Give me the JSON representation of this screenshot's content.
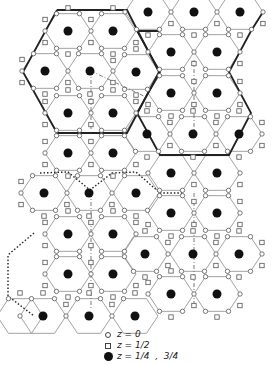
{
  "figure": {
    "width": 276,
    "height": 365,
    "hex_radius": 23,
    "colors": {
      "line": "#8a8a8a",
      "bold": "#222222",
      "dot": "#111111",
      "marker_stroke": "#555555"
    },
    "hexagon_centers": [
      [
        148,
        12
      ],
      [
        194,
        12
      ],
      [
        240,
        12
      ],
      [
        68,
        31
      ],
      [
        113,
        31
      ],
      [
        171,
        52
      ],
      [
        217,
        52
      ],
      [
        45,
        71
      ],
      [
        90,
        71
      ],
      [
        136,
        72
      ],
      [
        171,
        93
      ],
      [
        217,
        93
      ],
      [
        68,
        113
      ],
      [
        113,
        113
      ],
      [
        147,
        134
      ],
      [
        193,
        134
      ],
      [
        239,
        134
      ],
      [
        68,
        153
      ],
      [
        113,
        153
      ],
      [
        171,
        173
      ],
      [
        217,
        173
      ],
      [
        44,
        193
      ],
      [
        89,
        193
      ],
      [
        136,
        193
      ],
      [
        171,
        213
      ],
      [
        217,
        213
      ],
      [
        68,
        234
      ],
      [
        113,
        234
      ],
      [
        145,
        254
      ],
      [
        193,
        254
      ],
      [
        239,
        254
      ],
      [
        68,
        274
      ],
      [
        113,
        274
      ],
      [
        171,
        294
      ],
      [
        217,
        294
      ],
      [
        20,
        316
      ],
      [
        43,
        316
      ],
      [
        89,
        316
      ],
      [
        135,
        316
      ]
    ],
    "bold_outlines": [
      [
        [
          57,
          10
        ],
        [
          127,
          10
        ],
        [
          159,
          72
        ],
        [
          127,
          133
        ],
        [
          57,
          133
        ],
        [
          23,
          72
        ],
        [
          57,
          10
        ]
      ],
      [
        [
          159,
          31
        ],
        [
          137,
          31
        ],
        [
          160,
          72
        ],
        [
          137,
          113
        ],
        [
          160,
          155
        ],
        [
          183,
          155
        ],
        [
          229,
          155
        ],
        [
          251,
          113
        ],
        [
          229,
          72
        ],
        [
          251,
          31
        ],
        [
          263,
          12
        ]
      ]
    ],
    "dotted_outlines": [
      [
        [
          34,
          233
        ],
        [
          8,
          255
        ],
        [
          8,
          296
        ],
        [
          34,
          316
        ]
      ],
      [
        [
          40,
          173
        ],
        [
          68,
          172
        ],
        [
          90,
          190
        ],
        [
          112,
          173
        ],
        [
          136,
          172
        ],
        [
          160,
          193
        ],
        [
          182,
          193
        ]
      ]
    ],
    "dashdot_lines": [
      [
        [
          91,
          71
        ],
        [
          91,
          130
        ]
      ],
      [
        [
          91,
          71
        ],
        [
          148,
          98
        ]
      ],
      [
        [
          194,
          60
        ],
        [
          194,
          130
        ]
      ],
      [
        [
          91,
          193
        ],
        [
          91,
          310
        ]
      ],
      [
        [
          194,
          193
        ],
        [
          194,
          310
        ]
      ]
    ]
  },
  "legend": {
    "items": [
      {
        "symbol": "open-circle",
        "label": "z = 0"
      },
      {
        "symbol": "open-square",
        "label": "z = 1/2"
      },
      {
        "symbol": "filled-dot",
        "label": "z = 1/4  ,  3/4"
      }
    ]
  }
}
